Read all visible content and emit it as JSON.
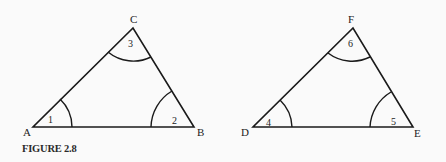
{
  "caption": "FIGURE 2.8",
  "triangles": [
    {
      "name": "ABC",
      "vertices": {
        "A": [
          33,
          127
        ],
        "B": [
          194,
          127
        ],
        "C": [
          133,
          28
        ]
      },
      "labels": {
        "A": "A",
        "B": "B",
        "C": "C"
      },
      "angles": {
        "a1": "1",
        "a2": "2",
        "a3": "3"
      }
    },
    {
      "name": "DEF",
      "vertices": {
        "D": [
          253,
          127
        ],
        "E": [
          413,
          127
        ],
        "F": [
          353,
          28
        ]
      },
      "labels": {
        "D": "D",
        "E": "E",
        "F": "F"
      },
      "angles": {
        "a4": "4",
        "a5": "5",
        "a6": "6"
      }
    }
  ],
  "colors": {
    "stroke": "#1a1a1a",
    "background": "#fafafa"
  }
}
